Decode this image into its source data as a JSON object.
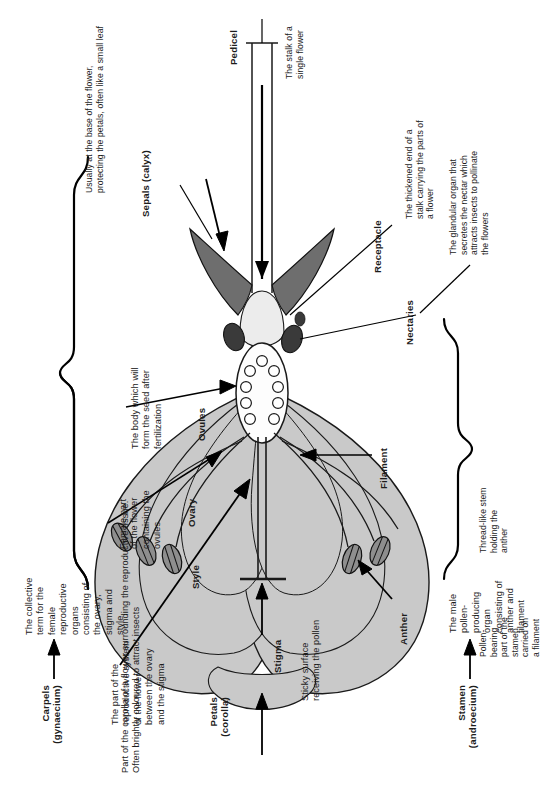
{
  "diagram": {
    "orientation": "rotated-90-ccw",
    "colors": {
      "petal_fill": "#c9c9c9",
      "petal_stroke": "#1a1a1a",
      "sepal_fill": "#6e6e6e",
      "anther_fill": "#8a8a8a",
      "ovary_fill": "#fdfdfd",
      "nectary_fill": "#3c3c3c",
      "receptacle_fill": "#e8e8e8",
      "text": "#1c1c1c"
    }
  },
  "labels": {
    "petals_title": "Petals\n(corolla)",
    "petals_desc": "Part of the corolla of a flower surrounding the reproductive tissue.\nOften brightly coloured to attract insects",
    "stamen_title": "Stamen\n(androecium)",
    "stamen_desc": "The male\npollen-\nproducing\norgan\nconsisting of\nanther and\nfilament",
    "carpels_title": "Carpels\n(gynaecium)",
    "carpels_desc": "The collective\nterm for the\nfemale\nreproductive\norgans\nconsisting of\nthe ovary,\nstigma and\nstyle",
    "stigma_title": "Stigma",
    "stigma_desc": "Sticky surface\nreceiving the pollen",
    "style_title": "Style",
    "style_desc": "The part of the\nreproductive system\nof the flower\nbetween the ovary\nand the stigma",
    "ovary_title": "Ovary",
    "ovary_desc": "Female part\nof the flower\ncontaining the\novules",
    "ovules_title": "Ovules",
    "ovules_desc": "The body which will\nform the seed after\nfertilization",
    "anther_title": "Anther",
    "anther_desc": "Pollen-\nbearing\npart of the\nstamen\ncarried on\na filament",
    "filament_title": "Filament",
    "filament_desc": "Thread-like stem\nholding the\nanther",
    "nectaries_title": "Nectaries",
    "nectaries_desc": "The glandular organ that\nsecretes the nectar which\nattracts insects to pollinate\nthe flowers",
    "receptacle_title": "Receptacle",
    "receptacle_desc": "The thickened end of a\nstalk carrying the parts of\na flower",
    "pedicel_title": "Pedicel",
    "pedicel_desc": "The stalk of a\nsingle flower",
    "sepals_title": "Sepals (calyx)",
    "sepals_desc": "Usually at the base of the flower,\nprotecting the petals, often like a small leaf"
  }
}
